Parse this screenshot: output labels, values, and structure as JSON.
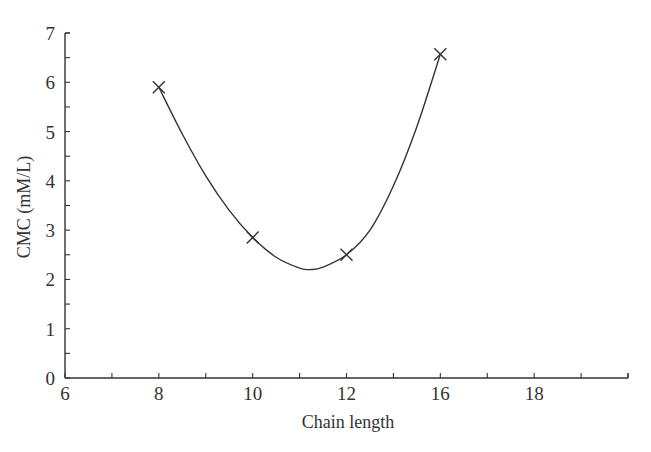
{
  "chart_data": {
    "type": "line",
    "title": "",
    "xlabel": "Chain length",
    "ylabel": "CMC (mM/L)",
    "x_tick_labels": [
      "6",
      "8",
      "10",
      "12",
      "16",
      "18"
    ],
    "y_tick_labels": [
      "0",
      "1",
      "2",
      "3",
      "4",
      "5",
      "6",
      "7"
    ],
    "xlim": [
      6,
      18
    ],
    "ylim": [
      0,
      7
    ],
    "grid": false,
    "legend": null,
    "series": [
      {
        "name": "CMC",
        "marker": "x",
        "x": [
          8,
          10,
          12,
          16
        ],
        "x_plot_position": [
          8,
          10,
          12,
          14
        ],
        "y": [
          5.9,
          2.85,
          2.5,
          6.57
        ]
      }
    ],
    "fitted_curve": {
      "x": [
        8,
        8.5,
        9,
        9.5,
        10,
        10.5,
        11,
        11.25,
        11.5,
        12,
        12.5,
        13,
        13.5,
        14
      ],
      "y": [
        5.9,
        4.95,
        4.1,
        3.4,
        2.85,
        2.45,
        2.23,
        2.2,
        2.25,
        2.5,
        3.0,
        3.9,
        5.1,
        6.57
      ]
    },
    "annotations": []
  }
}
